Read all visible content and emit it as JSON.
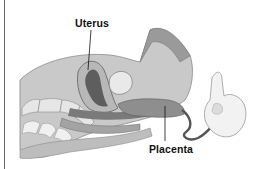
{
  "diagram": {
    "labels": [
      {
        "id": "uterus",
        "text": "Uterus"
      },
      {
        "id": "placenta",
        "text": "Placenta"
      }
    ],
    "colors": {
      "background": "#ffffff",
      "tissue_light": "#d9d9d9",
      "tissue_mid": "#a8a8a8",
      "tissue_dark": "#6e6e6e",
      "label_text": "#111111"
    }
  }
}
